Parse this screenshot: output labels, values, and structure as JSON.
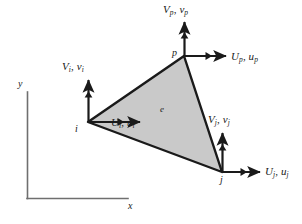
{
  "figure": {
    "type": "engineering-diagram",
    "colors": {
      "element_fill": "#c9c9c9",
      "stroke": "#1a1a1a",
      "axis": "#6b6b6b",
      "background": "#ffffff"
    }
  },
  "axes": {
    "x_label": "x",
    "y_label": "y",
    "origin": {
      "x": 27,
      "y": 198
    },
    "y_top": 92,
    "x_right": 128
  },
  "element": {
    "label": "e",
    "label_pos": {
      "x": 160,
      "y": 107
    },
    "vertices": [
      {
        "name": "i",
        "x": 88,
        "y": 122
      },
      {
        "name": "p",
        "x": 184,
        "y": 56
      },
      {
        "name": "j",
        "x": 222,
        "y": 172
      }
    ]
  },
  "nodes": [
    {
      "id": "i",
      "label": "i",
      "label_pos": {
        "x": 75,
        "y": 131
      },
      "vertical_force": {
        "name": "V",
        "sub": "i",
        "second": "v",
        "second_sub": "i",
        "text": "Vi, vi",
        "label_pos": {
          "x": 70,
          "y": 72
        }
      },
      "horizontal_force": {
        "name": "U",
        "sub": "i",
        "second": "u",
        "second_sub": "i",
        "text": "Ui, ui",
        "label_pos": {
          "x": 113,
          "y": 127
        }
      }
    },
    {
      "id": "p",
      "label": "p",
      "label_pos": {
        "x": 172,
        "y": 56
      },
      "vertical_force": {
        "name": "V",
        "sub": "p",
        "second": "v",
        "second_sub": "p",
        "text": "Vp, vp",
        "label_pos": {
          "x": 164,
          "y": 12
        }
      },
      "horizontal_force": {
        "name": "U",
        "sub": "p",
        "second": "u",
        "second_sub": "p",
        "text": "Up, up",
        "label_pos": {
          "x": 230,
          "y": 61
        }
      }
    },
    {
      "id": "j",
      "label": "j",
      "label_pos": {
        "x": 220,
        "y": 184
      },
      "vertical_force": {
        "name": "V",
        "sub": "j",
        "second": "v",
        "second_sub": "j",
        "text": "Vj, vj",
        "label_pos": {
          "x": 209,
          "y": 123
        }
      },
      "horizontal_force": {
        "name": "U",
        "sub": "j",
        "second": "u",
        "second_sub": "j",
        "text": "Uj, uj",
        "label_pos": {
          "x": 264,
          "y": 173
        }
      }
    }
  ]
}
